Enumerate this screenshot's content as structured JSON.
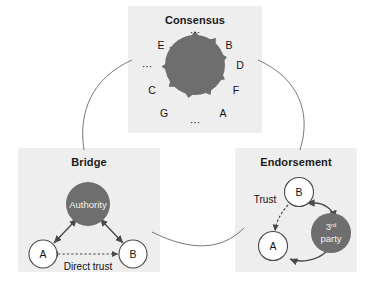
{
  "figure": {
    "background": "#ffffff",
    "panel_fill": "#eeeeee",
    "shape_fill": "#6e6e6e",
    "stroke": "#4a4a4a",
    "text_color": "#111111",
    "light_text": "#f2f2f2"
  },
  "panels": {
    "consensus": {
      "title": "Consensus",
      "shape": "ten-pointed-star-polygon",
      "node_labels": [
        "B",
        "D",
        "F",
        "A",
        "G",
        "C",
        "E"
      ],
      "ellipsis_top": "···",
      "ellipsis_bottom": "···",
      "ellipsis_left": "···",
      "labels": {
        "e": "E",
        "b": "B",
        "d": "D",
        "f": "F",
        "a": "A",
        "g": "G",
        "c": "C"
      }
    },
    "bridge": {
      "title": "Bridge",
      "authority_label": "Authority",
      "node_a": "A",
      "node_b": "B",
      "edge_label": "Direct trust"
    },
    "endorsement": {
      "title": "Endorsement",
      "node_a": "A",
      "node_b": "B",
      "third_party_line1": "3",
      "third_party_sup": "rd",
      "third_party_line2": "party",
      "edge_label": "Trust"
    }
  }
}
